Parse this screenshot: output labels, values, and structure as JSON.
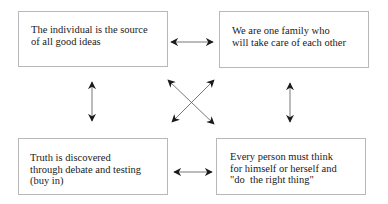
{
  "diagram": {
    "type": "four-quadrant relationship diagram",
    "boxes": [
      {
        "id": "top-left",
        "lines": [
          "The individual is the source",
          "of all good ideas"
        ]
      },
      {
        "id": "top-right",
        "lines": [
          "We are one family who",
          "will take care of each other"
        ]
      },
      {
        "id": "bottom-left",
        "lines": [
          "Truth is discovered",
          "through debate and testing",
          "(buy in)"
        ]
      },
      {
        "id": "bottom-right",
        "lines": [
          "Every person must think",
          "for himself or herself and",
          "\"do  the right thing\""
        ]
      }
    ],
    "connections": [
      {
        "from": "top-left",
        "to": "top-right",
        "style": "double-headed arrow"
      },
      {
        "from": "bottom-left",
        "to": "bottom-right",
        "style": "double-headed arrow"
      },
      {
        "from": "top-left",
        "to": "bottom-left",
        "style": "double-headed arrow"
      },
      {
        "from": "top-right",
        "to": "bottom-right",
        "style": "double-headed arrow"
      },
      {
        "from": "top-left",
        "to": "bottom-right",
        "style": "double-headed arrow (diagonal)"
      },
      {
        "from": "top-right",
        "to": "bottom-left",
        "style": "double-headed arrow (diagonal)"
      }
    ],
    "colors": {
      "border": "#b8b8b8",
      "arrow": "#1a1a1a",
      "text": "#1a1a1a",
      "background": "#ffffff"
    }
  },
  "text": {
    "tl": "The individual is the source\nof all good ideas",
    "tr": "We are one family who\nwill take care of each other",
    "bl": "Truth is discovered\nthrough debate and testing\n(buy in)",
    "br": "Every person must think\nfor himself or herself and\n\"do  the right thing\""
  }
}
